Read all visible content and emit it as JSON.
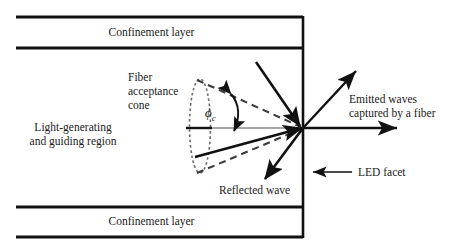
{
  "figure": {
    "background_color": "#ffffff",
    "line_color": "#111111",
    "dash_color": "#3a3a3a",
    "dotted_color": "#6b6b6b"
  },
  "labels": {
    "confinement_top": "Confinement layer",
    "confinement_bottom": "Confinement layer",
    "active_region": "Light-generating\nand guiding region",
    "acceptance_cone": "Fiber\nacceptance\ncone",
    "emitted_waves": "Emitted waves\ncaptured by a fiber",
    "led_facet": "LED facet",
    "reflected_wave": "Reflected wave",
    "critical_angle_symbol": "ϕ",
    "critical_angle_subscript": "c"
  },
  "geometry": {
    "facet_x": 303,
    "facet_point_y": 128,
    "slab_left_x": 16,
    "top_band": {
      "y_top": 16,
      "y_bottom": 49
    },
    "bottom_band": {
      "y_top": 206,
      "y_bottom": 238
    },
    "cone_ellipse": {
      "cx": 200,
      "cy": 126,
      "rx": 10,
      "ry": 47
    },
    "cone_axis_y": 128
  }
}
